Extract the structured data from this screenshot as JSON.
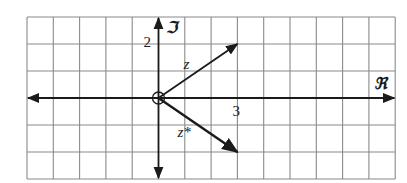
{
  "diagram": {
    "colors": {
      "background": "#ffffff",
      "grid": "#8a8a8a",
      "ink": "#1a1a1a"
    },
    "grid": {
      "columns": 14,
      "rows": 6,
      "x0": 27,
      "y0": 17,
      "cell_w": 26.3,
      "cell_h": 27
    },
    "origin": {
      "col": 5,
      "row": 3
    },
    "axes": {
      "real_label": "ℜ",
      "imag_label": "ℑ"
    },
    "ticks": {
      "real_tick": "3",
      "imag_tick": "2"
    },
    "vectors": [
      {
        "name": "z",
        "label": "z",
        "re": 3,
        "im": 2
      },
      {
        "name": "z-conjugate",
        "label": "z*",
        "re": 3,
        "im": -2
      }
    ],
    "origin_marker": "circle"
  }
}
